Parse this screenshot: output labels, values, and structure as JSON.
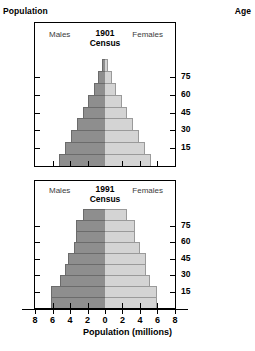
{
  "figure": {
    "population_caption": "Population",
    "age_caption": "Age",
    "x_axis_title": "Population (millions)"
  },
  "axes": {
    "age_ticks": [
      15,
      30,
      45,
      60,
      75
    ],
    "x_ticks": [
      8,
      6,
      4,
      2,
      0,
      2,
      4,
      6,
      8
    ],
    "x_limit": 8,
    "male_color": "#8e8e8e",
    "female_color": "#d4d4d4"
  },
  "panels": [
    {
      "id": "1901",
      "males_label": "Males",
      "females_label": "Females",
      "year": "1901",
      "census_label": "Census"
    },
    {
      "id": "1991",
      "males_label": "Males",
      "females_label": "Females",
      "year": "1991",
      "census_label": "Census"
    }
  ],
  "chart_data": {
    "type": "bar",
    "chart_kind": "population-pyramid",
    "xlabel": "Population (millions)",
    "ylabel": "Age",
    "xlim": [
      -8,
      8
    ],
    "x_tick_labels": [
      "8",
      "6",
      "4",
      "2",
      "0",
      "2",
      "4",
      "6",
      "8"
    ],
    "age_tick_labels": [
      "15",
      "30",
      "45",
      "60",
      "75"
    ],
    "grid": false,
    "legend": [
      "Males",
      "Females"
    ],
    "legend_position": "inside-top",
    "units": "millions",
    "charts": [
      {
        "name": "1901 Census",
        "age_bands": [
          "0-9",
          "10-19",
          "20-29",
          "30-39",
          "40-49",
          "50-59",
          "60-69",
          "70-79",
          "80+"
        ],
        "series": [
          {
            "name": "Males",
            "values": [
              5.3,
              4.6,
              3.9,
              3.2,
              2.5,
              1.9,
              1.3,
              0.8,
              0.35
            ]
          },
          {
            "name": "Females",
            "values": [
              5.3,
              4.6,
              3.9,
              3.2,
              2.5,
              1.9,
              1.3,
              0.8,
              0.35
            ]
          }
        ]
      },
      {
        "name": "1991 Census",
        "age_bands": [
          "0-9",
          "10-19",
          "20-29",
          "30-39",
          "40-49",
          "50-59",
          "60-69",
          "70-79",
          "80+"
        ],
        "series": [
          {
            "name": "Males",
            "values": [
              6.2,
              6.2,
              5.1,
              4.6,
              4.2,
              3.6,
              3.3,
              3.3,
              2.5
            ]
          },
          {
            "name": "Females",
            "values": [
              6.0,
              6.0,
              5.1,
              4.7,
              4.7,
              4.0,
              3.4,
              3.4,
              2.5
            ]
          }
        ]
      }
    ]
  }
}
